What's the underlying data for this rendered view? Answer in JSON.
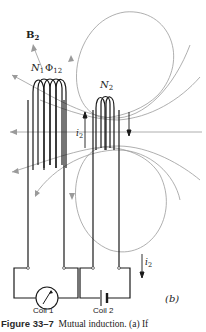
{
  "figure": {
    "labels": {
      "b2": "B",
      "b2_sub": "2",
      "n1": "N",
      "n1_sub": "1",
      "phi12": "Φ",
      "phi12_sub": "12",
      "n2": "N",
      "n2_sub": "2",
      "i2_upper": "i",
      "i2_upper_sub": "2",
      "i2_lower": "i",
      "i2_lower_sub": "2",
      "coil1": "Coil 1",
      "coil2": "Coil 2",
      "panel": "(b)"
    },
    "colors": {
      "wire": "#1a1a1a",
      "field_line": "#9a9a9a",
      "background": "#ffffff"
    }
  },
  "caption": {
    "figure_number": "Figure 33–7",
    "text": "Mutual induction. (a) If"
  }
}
